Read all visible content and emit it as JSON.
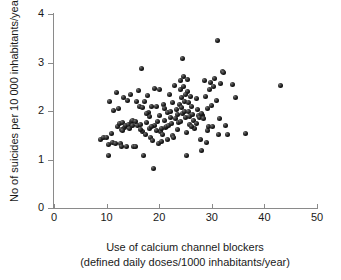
{
  "chart_data": {
    "type": "scatter",
    "title": "",
    "xlabel": "Use of calcium channel blockers",
    "xlabel_line2": "(defined daily doses/1000 inhabitants/year)",
    "ylabel": "No of suicides per 10 000 inhabitants/year",
    "xlim": [
      0,
      50
    ],
    "ylim": [
      0,
      4
    ],
    "xticks": [
      0,
      10,
      20,
      30,
      40,
      50
    ],
    "yticks": [
      0,
      1,
      2,
      3,
      4
    ],
    "xtick_labels": [
      "0",
      "10",
      "20",
      "30",
      "40",
      "50"
    ],
    "ytick_labels": [
      "0",
      "1",
      "2",
      "3",
      "4"
    ],
    "grid": false,
    "legend": false,
    "marker_color": "#1a1a1a",
    "axis_color": "#8a8a8a",
    "points": [
      [
        8.8,
        1.41
      ],
      [
        9.4,
        1.45
      ],
      [
        10.3,
        1.08
      ],
      [
        10.4,
        1.3
      ],
      [
        10.6,
        2.19
      ],
      [
        11.0,
        1.53
      ],
      [
        11.2,
        1.36
      ],
      [
        11.6,
        1.33
      ],
      [
        11.8,
        2.38
      ],
      [
        12.0,
        1.69
      ],
      [
        12.2,
        2.05
      ],
      [
        12.4,
        1.74
      ],
      [
        12.6,
        1.32
      ],
      [
        12.8,
        1.26
      ],
      [
        13.0,
        1.77
      ],
      [
        13.2,
        2.28
      ],
      [
        13.4,
        1.65
      ],
      [
        13.6,
        1.7
      ],
      [
        13.8,
        1.26
      ],
      [
        14.0,
        2.22
      ],
      [
        14.2,
        1.72
      ],
      [
        14.4,
        1.64
      ],
      [
        14.6,
        2.34
      ],
      [
        14.8,
        1.78
      ],
      [
        15.0,
        1.8
      ],
      [
        15.2,
        1.26
      ],
      [
        15.4,
        1.27
      ],
      [
        15.6,
        2.2
      ],
      [
        15.8,
        1.7
      ],
      [
        16.0,
        2.42
      ],
      [
        16.2,
        2.1
      ],
      [
        16.4,
        1.72
      ],
      [
        16.6,
        2.88
      ],
      [
        16.8,
        1.58
      ],
      [
        17.0,
        1.09
      ],
      [
        17.4,
        1.52
      ],
      [
        17.6,
        1.76
      ],
      [
        17.8,
        2.32
      ],
      [
        18.0,
        1.96
      ],
      [
        18.2,
        1.63
      ],
      [
        18.4,
        1.45
      ],
      [
        18.6,
        2.09
      ],
      [
        18.8,
        1.39
      ],
      [
        19.0,
        0.81
      ],
      [
        19.2,
        2.46
      ],
      [
        19.4,
        2.09
      ],
      [
        19.6,
        1.79
      ],
      [
        19.8,
        1.33
      ],
      [
        20.0,
        2.44
      ],
      [
        20.2,
        1.57
      ],
      [
        20.4,
        1.63
      ],
      [
        20.6,
        1.51
      ],
      [
        20.8,
        2.13
      ],
      [
        21.0,
        2.05
      ],
      [
        21.2,
        1.66
      ],
      [
        21.4,
        1.69
      ],
      [
        21.6,
        1.97
      ],
      [
        21.8,
        1.71
      ],
      [
        22.0,
        2.35
      ],
      [
        22.2,
        1.86
      ],
      [
        22.4,
        1.74
      ],
      [
        22.6,
        1.5
      ],
      [
        22.8,
        1.46
      ],
      [
        23.0,
        2.52
      ],
      [
        23.2,
        2.04
      ],
      [
        23.4,
        1.92
      ],
      [
        23.6,
        1.76
      ],
      [
        23.8,
        2.13
      ],
      [
        24.0,
        2.62
      ],
      [
        24.1,
        2.45
      ],
      [
        24.2,
        2.28
      ],
      [
        24.3,
        2.07
      ],
      [
        24.4,
        1.95
      ],
      [
        24.5,
        3.08
      ],
      [
        24.6,
        2.71
      ],
      [
        24.7,
        2.5
      ],
      [
        24.8,
        2.2
      ],
      [
        24.9,
        2.0
      ],
      [
        25.0,
        1.86
      ],
      [
        25.1,
        1.55
      ],
      [
        25.2,
        1.09
      ],
      [
        25.3,
        2.64
      ],
      [
        25.4,
        2.41
      ],
      [
        25.5,
        2.18
      ],
      [
        25.6,
        1.99
      ],
      [
        25.7,
        1.88
      ],
      [
        25.8,
        1.72
      ],
      [
        26.0,
        2.3
      ],
      [
        26.2,
        2.1
      ],
      [
        26.4,
        1.93
      ],
      [
        26.6,
        1.8
      ],
      [
        26.8,
        1.63
      ],
      [
        27.0,
        2.25
      ],
      [
        27.2,
        2.03
      ],
      [
        27.4,
        1.91
      ],
      [
        27.6,
        1.86
      ],
      [
        27.8,
        1.41
      ],
      [
        28.0,
        1.18
      ],
      [
        28.2,
        1.9
      ],
      [
        28.4,
        1.85
      ],
      [
        28.6,
        2.62
      ],
      [
        28.8,
        2.3
      ],
      [
        29.0,
        1.36
      ],
      [
        29.2,
        1.6
      ],
      [
        29.4,
        1.69
      ],
      [
        29.6,
        2.44
      ],
      [
        29.8,
        2.58
      ],
      [
        30.0,
        2.12
      ],
      [
        30.2,
        1.68
      ],
      [
        30.4,
        2.5
      ],
      [
        30.6,
        2.67
      ],
      [
        30.8,
        2.21
      ],
      [
        31.0,
        3.45
      ],
      [
        31.2,
        1.52
      ],
      [
        31.4,
        1.85
      ],
      [
        31.6,
        2.57
      ],
      [
        32.0,
        2.82
      ],
      [
        32.3,
        2.8
      ],
      [
        32.6,
        1.7
      ],
      [
        33.0,
        1.52
      ],
      [
        34.0,
        2.55
      ],
      [
        34.5,
        2.27
      ],
      [
        36.5,
        1.53
      ],
      [
        43.0,
        2.52
      ],
      [
        9.9,
        1.46
      ],
      [
        11.4,
        2.01
      ],
      [
        12.9,
        1.62
      ],
      [
        13.1,
        1.59
      ],
      [
        14.9,
        1.7
      ],
      [
        15.5,
        1.79
      ],
      [
        16.9,
        2.07
      ],
      [
        17.2,
        2.2
      ],
      [
        18.1,
        1.88
      ],
      [
        19.1,
        1.7
      ],
      [
        20.1,
        1.9
      ],
      [
        21.1,
        1.8
      ],
      [
        22.1,
        2.0
      ],
      [
        23.1,
        1.84
      ],
      [
        24.05,
        1.79
      ],
      [
        25.05,
        2.33
      ],
      [
        26.1,
        1.68
      ],
      [
        27.1,
        1.75
      ],
      [
        28.1,
        1.95
      ],
      [
        29.1,
        2.05
      ],
      [
        23.5,
        1.61
      ],
      [
        22.5,
        2.17
      ],
      [
        21.5,
        1.42
      ],
      [
        20.5,
        1.38
      ],
      [
        19.5,
        1.6
      ],
      [
        18.5,
        1.69
      ],
      [
        17.5,
        1.95
      ],
      [
        16.5,
        1.61
      ]
    ]
  }
}
